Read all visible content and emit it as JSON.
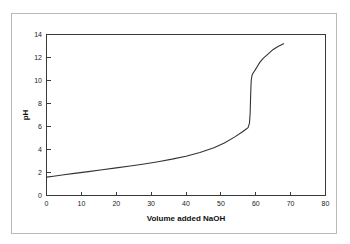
{
  "figure": {
    "background_color": "#ffffff",
    "frame_color": "#b9b9b9",
    "line_color": "#333333",
    "axis_color": "#3a3a3a"
  },
  "chart_data": {
    "type": "line",
    "title": "",
    "subtitle": "",
    "xlabel": "Volume added NaOH",
    "ylabel": "pH",
    "xlim": [
      0,
      80
    ],
    "ylim": [
      0,
      14
    ],
    "xticks": [
      0,
      10,
      20,
      30,
      40,
      50,
      60,
      70,
      80
    ],
    "xtick_labels": [
      "0",
      "10",
      "20",
      "30",
      "40",
      "50",
      "60",
      "70",
      "80"
    ],
    "yticks": [
      0,
      2,
      4,
      6,
      8,
      10,
      12,
      14
    ],
    "ytick_labels": [
      "0",
      "2",
      "4",
      "6",
      "8",
      "10",
      "12",
      "14"
    ],
    "grid": false,
    "legend": false,
    "legend_position": "none",
    "series": [
      {
        "name": "Titration curve",
        "color": "#333333",
        "x": [
          0,
          2,
          5,
          8,
          12,
          16,
          20,
          24,
          28,
          32,
          36,
          40,
          44,
          48,
          51,
          54,
          56,
          57,
          57.8,
          58.2,
          58.4,
          58.5,
          58.6,
          58.7,
          58.9,
          59.1,
          59.4,
          59.8,
          60.4,
          61.2,
          62.2,
          63.5,
          65,
          66.5,
          68
        ],
        "y": [
          1.6,
          1.68,
          1.8,
          1.92,
          2.08,
          2.24,
          2.4,
          2.56,
          2.74,
          2.94,
          3.16,
          3.42,
          3.74,
          4.16,
          4.56,
          5.1,
          5.5,
          5.72,
          5.9,
          6.3,
          7.2,
          8.3,
          9.3,
          10.0,
          10.4,
          10.58,
          10.72,
          10.9,
          11.2,
          11.6,
          11.95,
          12.3,
          12.7,
          12.98,
          13.2
        ]
      }
    ],
    "annotations": []
  }
}
